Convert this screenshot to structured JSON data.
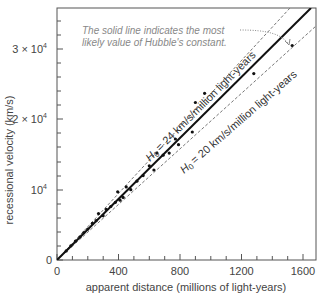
{
  "chart_data": {
    "type": "scatter",
    "title": "",
    "xlabel": "apparent distance (millions of light-years)",
    "ylabel": "recessional velocity (km/s)",
    "xlim": [
      0,
      1690
    ],
    "ylim": [
      0,
      36500
    ],
    "x_ticks": [
      0,
      400,
      800,
      1200,
      1600
    ],
    "x_tick_labels": [
      "0",
      "400",
      "800",
      "1200",
      "1600"
    ],
    "y_ticks": [
      0,
      10000,
      20000,
      30000
    ],
    "y_tick_labels": [
      "0",
      "10⁴",
      "2 × 10⁴",
      "3 × 10⁴"
    ],
    "grid": false,
    "lines": [
      {
        "name": "best fit",
        "style": "solid",
        "slope": 22,
        "label": ""
      },
      {
        "name": "H0 = 24",
        "style": "dashed",
        "slope": 24,
        "label": "H₀ = 24 km/s/million light-years"
      },
      {
        "name": "H0 = 20",
        "style": "dashed",
        "slope": 20,
        "label": "H₀ = 20 km/s/million light-years"
      }
    ],
    "points": [
      {
        "x": 60,
        "y": 1300
      },
      {
        "x": 90,
        "y": 2000
      },
      {
        "x": 120,
        "y": 2700
      },
      {
        "x": 150,
        "y": 3300
      },
      {
        "x": 175,
        "y": 3900
      },
      {
        "x": 200,
        "y": 4400
      },
      {
        "x": 230,
        "y": 5200
      },
      {
        "x": 255,
        "y": 5600
      },
      {
        "x": 270,
        "y": 6600
      },
      {
        "x": 300,
        "y": 6300
      },
      {
        "x": 320,
        "y": 7200
      },
      {
        "x": 350,
        "y": 7600
      },
      {
        "x": 380,
        "y": 8200
      },
      {
        "x": 395,
        "y": 9700
      },
      {
        "x": 410,
        "y": 8500
      },
      {
        "x": 430,
        "y": 8900
      },
      {
        "x": 450,
        "y": 10400
      },
      {
        "x": 480,
        "y": 10000
      },
      {
        "x": 520,
        "y": 11200
      },
      {
        "x": 560,
        "y": 12000
      },
      {
        "x": 600,
        "y": 13400
      },
      {
        "x": 630,
        "y": 12800
      },
      {
        "x": 650,
        "y": 15200
      },
      {
        "x": 690,
        "y": 14900
      },
      {
        "x": 730,
        "y": 15200
      },
      {
        "x": 770,
        "y": 17200
      },
      {
        "x": 790,
        "y": 16400
      },
      {
        "x": 880,
        "y": 18200
      },
      {
        "x": 900,
        "y": 22400
      },
      {
        "x": 960,
        "y": 23700
      },
      {
        "x": 1280,
        "y": 26500
      },
      {
        "x": 1530,
        "y": 30500
      }
    ],
    "annotations": [
      {
        "text": "The solid line indicates the most likely value of Hubble's constant.",
        "arrow_to": {
          "x": 1350,
          "y": 30400
        }
      }
    ]
  },
  "labels": {
    "xlabel": "apparent distance (millions of light-years)",
    "ylabel": "recessional velocity (km/s)",
    "x_ticks": [
      "0",
      "400",
      "800",
      "1200",
      "1600"
    ],
    "y_ticks": {
      "zero": "0",
      "one": "10",
      "two_coef": "2 × 10",
      "three_coef": "3 × 10",
      "exp": "4"
    },
    "annotation_line1": "The solid line indicates the most",
    "annotation_line2": "likely value of Hubble's constant.",
    "upper_line_label": "= 24 km/s/million light-years",
    "lower_line_label": "= 20 km/s/million light-years",
    "h0_symbol": "H",
    "h0_sub": "0"
  },
  "colors": {
    "axis": "#555555",
    "solid_line": "#111111",
    "dashed_line": "#777777",
    "points": "#111111",
    "annotation": "#888888"
  }
}
